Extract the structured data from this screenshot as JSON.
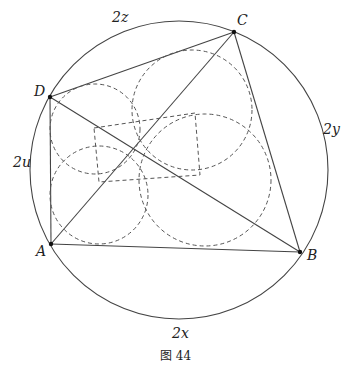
{
  "figure": {
    "caption": "图 44",
    "circumcircle": {
      "cx": 179,
      "cy": 170,
      "r": 149
    },
    "points": {
      "A": {
        "label": "A",
        "x": 51,
        "y": 244
      },
      "B": {
        "label": "B",
        "x": 300,
        "y": 252
      },
      "C": {
        "label": "C",
        "x": 234,
        "y": 32
      },
      "D": {
        "label": "D",
        "x": 50,
        "y": 97
      }
    },
    "arc_labels": {
      "z": "2z",
      "y": "2y",
      "u": "2u",
      "x": "2x"
    },
    "incircles": [
      {
        "cx": 95,
        "cy": 129,
        "r": 45
      },
      {
        "cx": 192,
        "cy": 110,
        "r": 60
      },
      {
        "cx": 99,
        "cy": 195,
        "r": 49
      },
      {
        "cx": 205,
        "cy": 180,
        "r": 66
      }
    ],
    "incenter_quadrilateral": [
      [
        94,
        128
      ],
      [
        195,
        113
      ],
      [
        200,
        175
      ],
      [
        99,
        182
      ]
    ]
  }
}
